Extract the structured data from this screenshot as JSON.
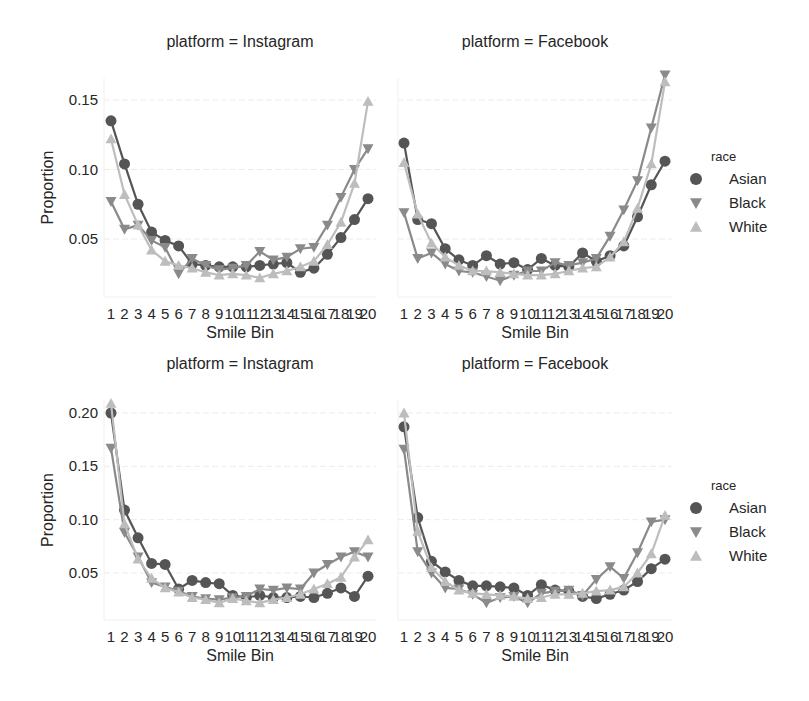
{
  "chart_data": [
    {
      "type": "line",
      "title": "platform = Instagram",
      "xlabel": "Smile Bin",
      "ylabel": "Proportion",
      "row": 0,
      "col": 0,
      "yticks": [
        0.05,
        0.1,
        0.15
      ],
      "ytick_labels": [
        "0.05",
        "0.10",
        "0.15"
      ],
      "ylim": [
        0.008,
        0.164
      ],
      "x": [
        1,
        2,
        3,
        4,
        5,
        6,
        7,
        8,
        9,
        10,
        11,
        12,
        13,
        14,
        15,
        16,
        17,
        18,
        19,
        20
      ],
      "series": [
        {
          "name": "Asian",
          "values": [
            0.135,
            0.104,
            0.075,
            0.055,
            0.049,
            0.045,
            0.032,
            0.031,
            0.03,
            0.03,
            0.03,
            0.031,
            0.032,
            0.033,
            0.026,
            0.029,
            0.039,
            0.051,
            0.064,
            0.079
          ]
        },
        {
          "name": "Black",
          "values": [
            0.077,
            0.057,
            0.06,
            0.049,
            0.044,
            0.025,
            0.036,
            0.031,
            0.028,
            0.029,
            0.031,
            0.041,
            0.035,
            0.037,
            0.043,
            0.044,
            0.06,
            0.08,
            0.1,
            0.115
          ]
        },
        {
          "name": "White",
          "values": [
            0.122,
            0.082,
            0.06,
            0.042,
            0.034,
            0.031,
            0.029,
            0.026,
            0.024,
            0.025,
            0.024,
            0.022,
            0.025,
            0.027,
            0.03,
            0.034,
            0.046,
            0.062,
            0.09,
            0.149
          ]
        }
      ],
      "grid": true
    },
    {
      "type": "line",
      "title": "platform = Facebook",
      "xlabel": "Smile Bin",
      "ylabel": "",
      "row": 0,
      "col": 1,
      "yticks": [
        0.05,
        0.1,
        0.15
      ],
      "ytick_labels": [],
      "ylim": [
        0.008,
        0.164
      ],
      "x": [
        1,
        2,
        3,
        4,
        5,
        6,
        7,
        8,
        9,
        10,
        11,
        12,
        13,
        14,
        15,
        16,
        17,
        18,
        19,
        20
      ],
      "series": [
        {
          "name": "Asian",
          "values": [
            0.119,
            0.064,
            0.061,
            0.043,
            0.035,
            0.031,
            0.038,
            0.032,
            0.033,
            0.028,
            0.036,
            0.031,
            0.03,
            0.04,
            0.034,
            0.038,
            0.045,
            0.066,
            0.089,
            0.106
          ]
        },
        {
          "name": "Black",
          "values": [
            0.069,
            0.036,
            0.04,
            0.032,
            0.027,
            0.026,
            0.023,
            0.02,
            0.024,
            0.027,
            0.027,
            0.033,
            0.031,
            0.033,
            0.036,
            0.052,
            0.071,
            0.092,
            0.13,
            0.168
          ]
        },
        {
          "name": "White",
          "values": [
            0.105,
            0.068,
            0.047,
            0.037,
            0.031,
            0.027,
            0.027,
            0.026,
            0.025,
            0.024,
            0.024,
            0.025,
            0.027,
            0.029,
            0.03,
            0.037,
            0.048,
            0.072,
            0.104,
            0.163
          ]
        }
      ],
      "grid": true
    },
    {
      "type": "line",
      "title": "platform = Instagram",
      "xlabel": "Smile Bin",
      "ylabel": "Proportion",
      "row": 1,
      "col": 0,
      "yticks": [
        0.05,
        0.1,
        0.15,
        0.2
      ],
      "ytick_labels": [
        "0.05",
        "0.10",
        "0.15",
        "0.20"
      ],
      "ylim": [
        0.006,
        0.212
      ],
      "x": [
        1,
        2,
        3,
        4,
        5,
        6,
        7,
        8,
        9,
        10,
        11,
        12,
        13,
        14,
        15,
        16,
        17,
        18,
        19,
        20
      ],
      "series": [
        {
          "name": "Asian",
          "values": [
            0.2,
            0.109,
            0.083,
            0.059,
            0.058,
            0.035,
            0.043,
            0.041,
            0.04,
            0.029,
            0.027,
            0.029,
            0.027,
            0.027,
            0.028,
            0.027,
            0.031,
            0.036,
            0.028,
            0.047
          ]
        },
        {
          "name": "Black",
          "values": [
            0.167,
            0.088,
            0.065,
            0.041,
            0.037,
            0.033,
            0.028,
            0.026,
            0.025,
            0.027,
            0.028,
            0.035,
            0.034,
            0.036,
            0.035,
            0.05,
            0.058,
            0.065,
            0.07,
            0.065
          ]
        },
        {
          "name": "White",
          "values": [
            0.209,
            0.096,
            0.063,
            0.045,
            0.036,
            0.032,
            0.027,
            0.025,
            0.022,
            0.026,
            0.024,
            0.022,
            0.025,
            0.027,
            0.03,
            0.035,
            0.04,
            0.046,
            0.065,
            0.081
          ]
        }
      ],
      "grid": true
    },
    {
      "type": "line",
      "title": "platform = Facebook",
      "xlabel": "Smile Bin",
      "ylabel": "",
      "row": 1,
      "col": 1,
      "yticks": [
        0.05,
        0.1,
        0.15,
        0.2
      ],
      "ytick_labels": [],
      "ylim": [
        0.006,
        0.212
      ],
      "x": [
        1,
        2,
        3,
        4,
        5,
        6,
        7,
        8,
        9,
        10,
        11,
        12,
        13,
        14,
        15,
        16,
        17,
        18,
        19,
        20
      ],
      "series": [
        {
          "name": "Asian",
          "values": [
            0.187,
            0.102,
            0.061,
            0.051,
            0.043,
            0.038,
            0.038,
            0.037,
            0.036,
            0.029,
            0.039,
            0.034,
            0.033,
            0.028,
            0.026,
            0.03,
            0.034,
            0.042,
            0.054,
            0.063
          ]
        },
        {
          "name": "Black",
          "values": [
            0.166,
            0.07,
            0.05,
            0.036,
            0.035,
            0.03,
            0.022,
            0.027,
            0.028,
            0.022,
            0.031,
            0.033,
            0.034,
            0.029,
            0.044,
            0.056,
            0.045,
            0.069,
            0.098,
            0.1
          ]
        },
        {
          "name": "White",
          "values": [
            0.2,
            0.089,
            0.055,
            0.042,
            0.034,
            0.031,
            0.03,
            0.029,
            0.028,
            0.026,
            0.027,
            0.03,
            0.03,
            0.031,
            0.033,
            0.034,
            0.037,
            0.05,
            0.068,
            0.104
          ]
        }
      ],
      "grid": true
    }
  ],
  "legends": [
    {
      "title": "race",
      "entries": [
        {
          "label": "Asian",
          "marker": "circle",
          "color": "#555555"
        },
        {
          "label": "Black",
          "marker": "triangle-down",
          "color": "#8a8a8a"
        },
        {
          "label": "White",
          "marker": "triangle-up",
          "color": "#bdbdbd"
        }
      ]
    },
    {
      "title": "race",
      "entries": [
        {
          "label": "Asian",
          "marker": "circle",
          "color": "#555555"
        },
        {
          "label": "Black",
          "marker": "triangle-down",
          "color": "#8a8a8a"
        },
        {
          "label": "White",
          "marker": "triangle-up",
          "color": "#bdbdbd"
        }
      ]
    }
  ],
  "colors": {
    "Asian": "#555555",
    "Black": "#8a8a8a",
    "White": "#bdbdbd",
    "grid": "#ececec",
    "text": "#262626"
  }
}
